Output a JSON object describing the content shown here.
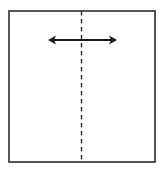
{
  "diagram": {
    "colors": {
      "background": "#ffffff",
      "outline": "#2b2b2b",
      "fold_line": "#2b2b2b",
      "arrow": "#1a1a1a"
    },
    "elements": {
      "square": {
        "label": "paper square"
      },
      "fold_line": {
        "label": "vertical valley fold (dashed)",
        "style": "dashed"
      },
      "arrow": {
        "label": "horizontal double-headed arrow",
        "direction": "left-right"
      }
    }
  }
}
